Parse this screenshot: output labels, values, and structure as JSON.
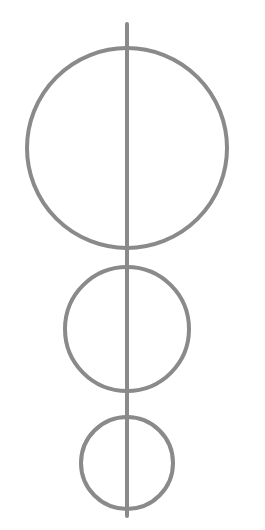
{
  "canvas": {
    "width": 265,
    "height": 530,
    "background_color": "#ffffff",
    "title": "Three tangent circles on a vertical axis"
  },
  "style": {
    "stroke_color": "#8a8a8a",
    "stroke_width": 4,
    "fill": "none"
  },
  "chart_data": {
    "type": "diagram",
    "background": "#ffffff",
    "stroke_color": "#8a8a8a",
    "stroke_width": 4,
    "axis_x": 127,
    "shapes": [
      {
        "name": "large-circle",
        "type": "circle",
        "cx": 127,
        "cy": 148,
        "r": 100,
        "bounds": {
          "left": 27,
          "right": 227,
          "top": 24,
          "bottom": 248
        }
      },
      {
        "name": "medium-circle",
        "type": "circle",
        "cx": 127,
        "cy": 329,
        "r": 62,
        "bounds": {
          "left": 65,
          "right": 189,
          "top": 267,
          "bottom": 391
        }
      },
      {
        "name": "small-circle",
        "type": "circle",
        "cx": 127,
        "cy": 463,
        "r": 46,
        "bounds": {
          "left": 81,
          "right": 173,
          "top": 417,
          "bottom": 509
        }
      },
      {
        "name": "vertical-axis-line",
        "type": "line",
        "x1": 127,
        "y1": 24,
        "x2": 127,
        "y2": 516
      }
    ],
    "tangency_points": [
      {
        "name": "large-medium-tangency",
        "x": 127,
        "y": 248
      },
      {
        "name": "medium-small-tangency",
        "x": 127,
        "y": 410
      }
    ],
    "labels": [],
    "legend": null,
    "grid": false
  }
}
